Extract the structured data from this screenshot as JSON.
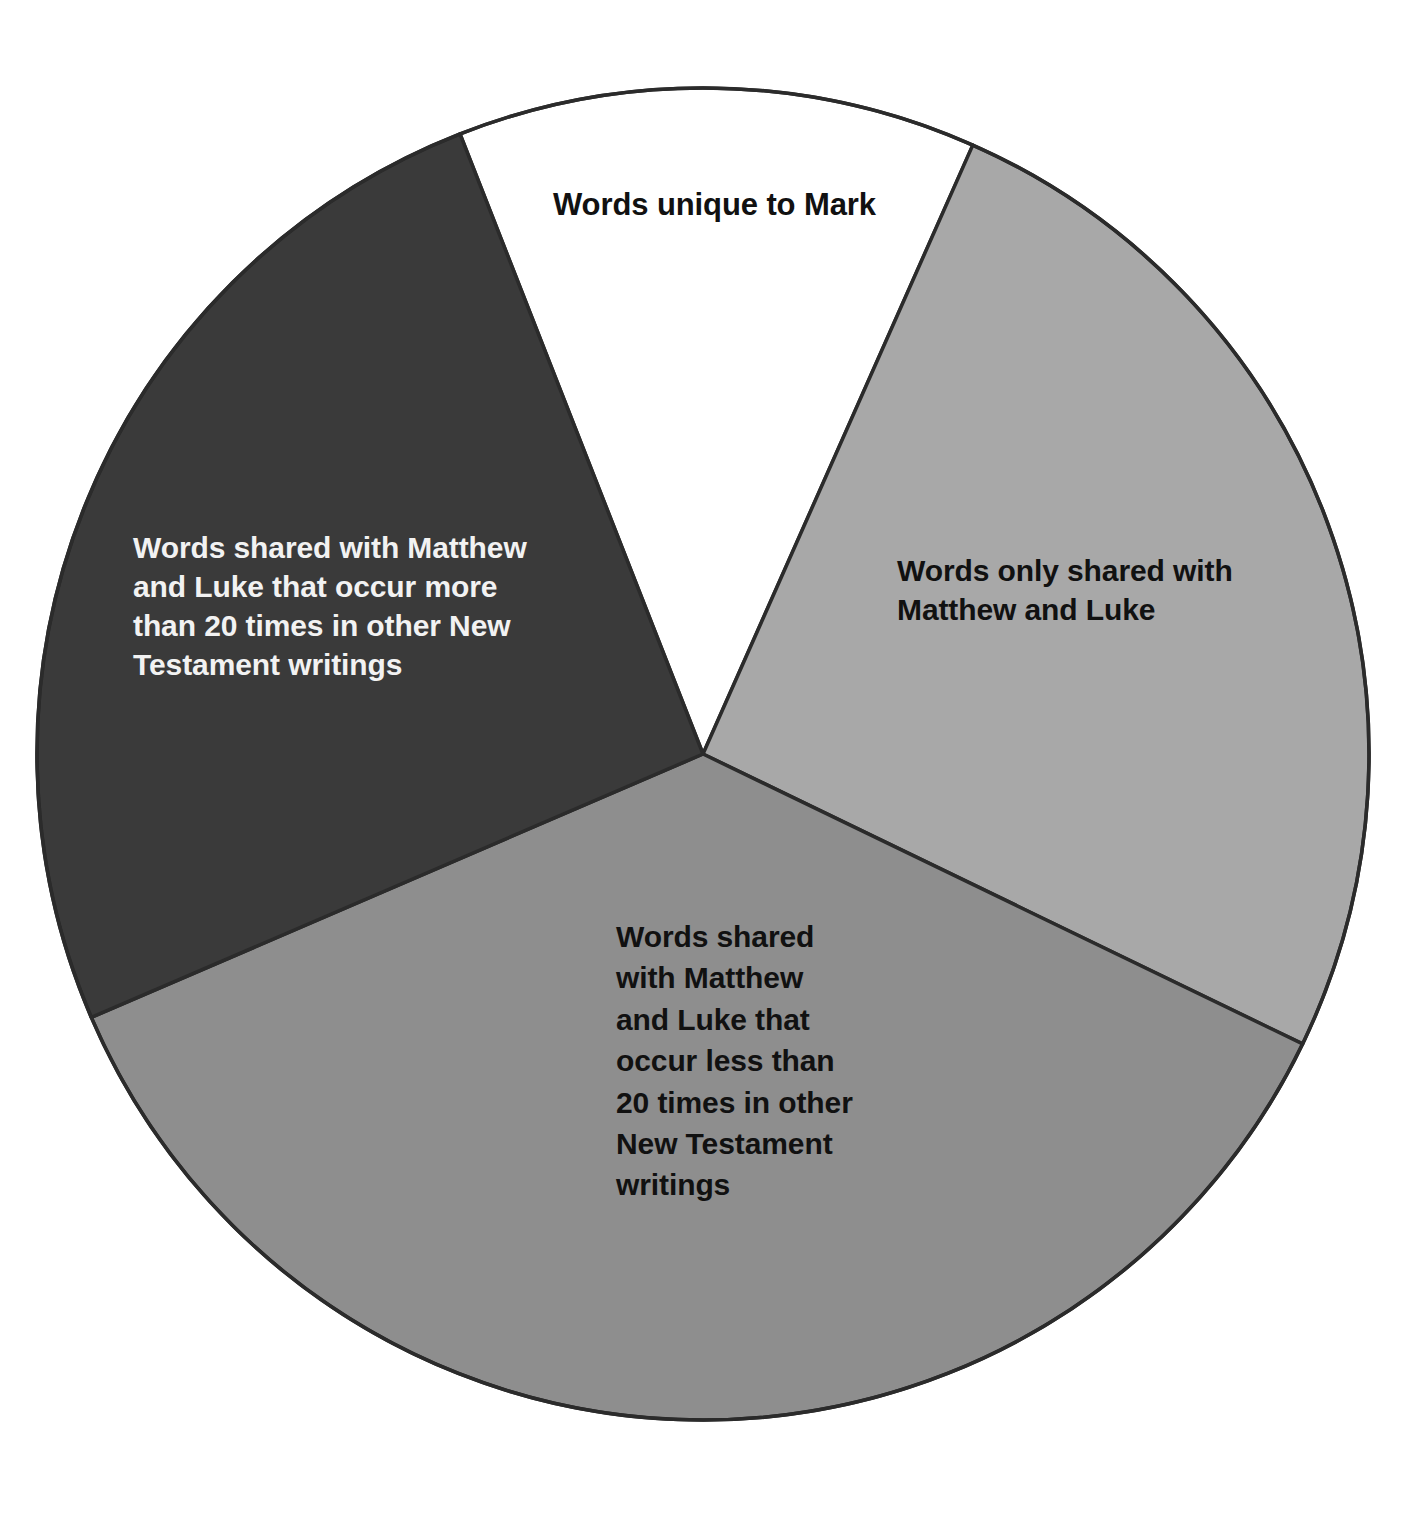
{
  "figure": {
    "background_color": "#ffffff",
    "outline_color": "#2b2b2b"
  },
  "chart_data": {
    "type": "pie",
    "title": "",
    "subtitle": "",
    "xlabel": "",
    "ylabel": "",
    "grid": false,
    "legend_position": "none",
    "labels_inside_slices": true,
    "center": {
      "x": 703,
      "y": 754
    },
    "radius": 666,
    "start_angle_deg_from_top": -21.4,
    "direction": "clockwise",
    "categories": [
      "Words unique to Mark",
      "Words only shared with Matthew and Luke",
      "Words shared with Matthew and Luke that occur less than 20 times in other New Testament writings",
      "Words shared with Matthew and Luke that occur more than 20 times in other New Testament writings"
    ],
    "values": [
      45,
      92,
      131,
      92
    ],
    "value_unit": "degrees of arc",
    "percentages": [
      12.5,
      25.6,
      36.4,
      25.6
    ],
    "colors": [
      "#ffffff",
      "#a8a8a8",
      "#8e8e8e",
      "#3a3a3a"
    ],
    "slices": [
      {
        "name": "words-unique-to-mark",
        "label": "Words unique to Mark",
        "color": "#ffffff",
        "text_color": "#111111",
        "start_deg": -21.4,
        "end_deg": 23.9,
        "sweep_deg": 45.3,
        "percent": 12.5
      },
      {
        "name": "words-only-shared-matthew-luke",
        "label": "Words only shared with\nMatthew and Luke",
        "color": "#a8a8a8",
        "text_color": "#111111",
        "start_deg": 23.9,
        "end_deg": 115.8,
        "sweep_deg": 91.9,
        "percent": 25.6
      },
      {
        "name": "words-shared-less-than-20",
        "label": "Words shared\nwith Matthew\nand Luke that\noccur less than\n20 times in other\nNew Testament\nwritings",
        "color": "#8e8e8e",
        "text_color": "#111111",
        "start_deg": 115.8,
        "end_deg": 246.7,
        "sweep_deg": 130.9,
        "percent": 36.4
      },
      {
        "name": "words-shared-more-than-20",
        "label": "Words shared with Matthew\nand Luke that occur more\nthan 20 times in other New\nTestament writings",
        "color": "#3a3a3a",
        "text_color": "#f2f2f2",
        "start_deg": 246.7,
        "end_deg": 338.6,
        "sweep_deg": 91.9,
        "percent": 25.6
      }
    ]
  },
  "labels": {
    "unique_to_mark": "Words unique to Mark",
    "only_shared_with_matthew_and_luke": "Words only shared with\nMatthew and Luke",
    "shared_more_than_20": "Words shared with Matthew\nand Luke that occur more\nthan 20 times in other New\nTestament writings",
    "shared_less_than_20": "Words shared\nwith Matthew\nand Luke that\noccur less than\n20 times in other\nNew Testament\nwritings"
  }
}
